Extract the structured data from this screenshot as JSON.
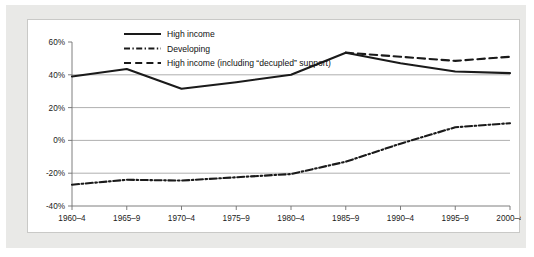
{
  "chart_data": {
    "type": "line",
    "title": "",
    "subtitle": "",
    "xlabel": "",
    "ylabel": "",
    "categories": [
      "1960–4",
      "1965–9",
      "1970–4",
      "1975–9",
      "1980–4",
      "1985–9",
      "1990–4",
      "1995–9",
      "2000–4"
    ],
    "ytick_labels": [
      "60%",
      "40%",
      "20%",
      "0%",
      "-20%",
      "-40%"
    ],
    "ytick_values": [
      60,
      40,
      20,
      0,
      -20,
      -40
    ],
    "ylim": [
      -40,
      60
    ],
    "grid": "horizontal",
    "gridline_values": [
      40,
      20,
      0,
      -20
    ],
    "legend_position": "top-left-inside",
    "series": [
      {
        "name": "High income",
        "style": "solid",
        "color": "#1a1a1a",
        "x": [
          "1960–4",
          "1965–9",
          "1970–4",
          "1975–9",
          "1980–4",
          "1985–9",
          "1990–4",
          "1995–9",
          "2000–4"
        ],
        "values": [
          39,
          43.5,
          31.5,
          35.5,
          40,
          53.5,
          47,
          42,
          41
        ]
      },
      {
        "name": "Developing",
        "style": "dash-dot",
        "color": "#1a1a1a",
        "x": [
          "1960–4",
          "1965–9",
          "1970–4",
          "1975–9",
          "1980–4",
          "1985–9",
          "1990–4",
          "1995–9",
          "2000–4"
        ],
        "values": [
          -27,
          -24,
          -24.5,
          -22.5,
          -20.5,
          -13,
          -2,
          8,
          10.5
        ]
      },
      {
        "name": "High income (including “decupled” support)",
        "style": "dashed",
        "color": "#1a1a1a",
        "x": [
          "1985–9",
          "1990–4",
          "1995–9",
          "2000–4"
        ],
        "values": [
          53.5,
          51,
          48.5,
          51
        ]
      }
    ]
  },
  "legend": {
    "items": [
      {
        "label": "High income",
        "style": "solid"
      },
      {
        "label": "Developing",
        "style": "dash-dot"
      },
      {
        "label": "High income (including “decupled” support)",
        "style": "dashed"
      }
    ]
  },
  "colors": {
    "frame": "#e9e9e7",
    "panel_background": "#ffffff",
    "panel_border": "#c9c9c7",
    "gridline": "#9a9a9a",
    "axis": "#6f6f6f",
    "ink": "#1a1a1a"
  }
}
